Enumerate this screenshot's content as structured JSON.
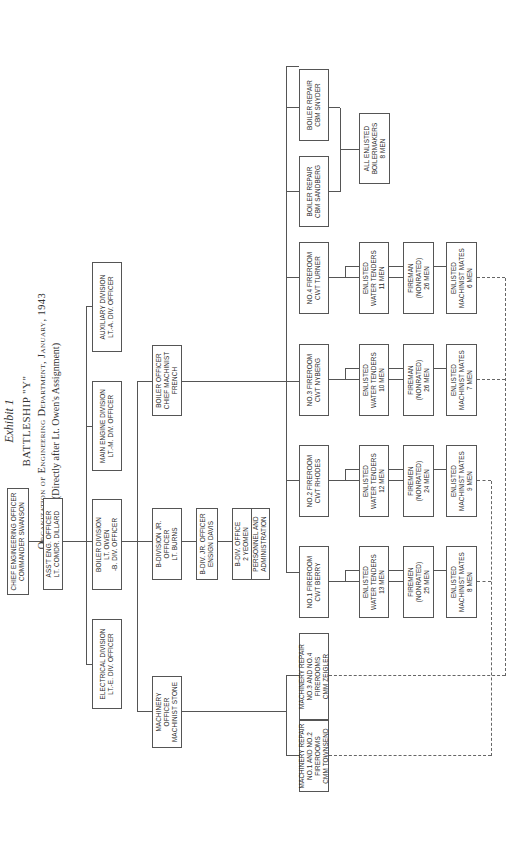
{
  "header": {
    "exhibit": "Exhibit 1",
    "ship": "BATTLESHIP \"Y\"",
    "subtitle": "Organization of Engineering Department, January, 1943",
    "note": "(Directly after Lt. Owen's Assignment)"
  },
  "chart": {
    "chief": [
      "CHIEF ENGINEERING OFFICER",
      "COMMANDER SWANSON"
    ],
    "asst": [
      "ASS'T ENG. OFFICER",
      "LT. COMDR. DILLARD"
    ],
    "divisions": [
      {
        "id": "electrical",
        "lines": [
          "ELECTRICAL DIVISION",
          "LT.-E. DIV. OFFICER"
        ]
      },
      {
        "id": "boiler",
        "lines": [
          "BOILER DIVISION",
          "LT. OWEN",
          "-B. DIV. OFFICER"
        ]
      },
      {
        "id": "main-engine",
        "lines": [
          "MAIN ENGINE DIVISION",
          "LT.-M. DIV. OFFICER"
        ]
      },
      {
        "id": "auxiliary",
        "lines": [
          "AUXILIARY DIVISION",
          "LT.-A. DIV. OFFICER"
        ]
      }
    ],
    "boiler_sub": {
      "machinery_officer": [
        "MACHINERY",
        "OFFICER",
        "MACHINIST STONE"
      ],
      "b_div_jr": [
        "B-DIVISION JR.",
        "OFFICER",
        "LT. BURNS"
      ],
      "boiler_officer": [
        "BOILER OFFICER",
        "CHIEF MACHINIST",
        "FRENCH"
      ],
      "ensign": [
        "B-DIV. JR. OFFICER",
        "ENSIGN DAVIS"
      ],
      "office_top": [
        "B-DIV. OFFICE",
        "2 YEOMEN"
      ],
      "office_bottom": [
        "PERSONNEL AND",
        "ADMINISTRATION"
      ]
    },
    "machinery_repair": [
      [
        "MACHINERY REPAIR",
        "NO.1 AND NO.2",
        "FIREROOMS",
        "CMM TOWNSEND"
      ],
      [
        "MACHINERY REPAIR",
        "NO.3 AND NO.4",
        "FIREROOMS",
        "CMM ZEIGLER"
      ]
    ],
    "firerooms": [
      {
        "head": [
          "NO.1 FIREROOM",
          "CWT BERRY"
        ],
        "water": [
          "ENLISTED",
          "WATER TENDERS",
          "13 MEN"
        ],
        "firemen": [
          "FIREMEN",
          "(NONRATED)",
          "25 MEN"
        ],
        "mates": [
          "ENLISTED",
          "MACHINIST MATES",
          "8 MEN"
        ]
      },
      {
        "head": [
          "NO.2 FIREROOM",
          "CWT RHODES"
        ],
        "water": [
          "ENLISTED",
          "WATER TENDERS",
          "12 MEN"
        ],
        "firemen": [
          "FIREMEN",
          "(NONRATED)",
          "24 MEN"
        ],
        "mates": [
          "ENLISTED",
          "MACHINIST MATES",
          "9 MEN"
        ]
      },
      {
        "head": [
          "NO.3 FIREROOM",
          "CWT NYBERG"
        ],
        "water": [
          "ENLISTED",
          "WATER TENDERS",
          "10 MEN"
        ],
        "firemen": [
          "FIREMAN",
          "(NONRATED)",
          "26 MEN"
        ],
        "mates": [
          "ENLISTED",
          "MACHINIST MATES",
          "7 MEN"
        ]
      },
      {
        "head": [
          "NO.4 FIREROOM",
          "CWT TURNER"
        ],
        "water": [
          "ENLISTED",
          "WATER TENDERS",
          "11 MEN"
        ],
        "firemen": [
          "FIREMAN",
          "(NONRATED)",
          "26 MEN"
        ],
        "mates": [
          "ENLISTED",
          "MACHINIST MATES",
          "6 MEN"
        ]
      }
    ],
    "boiler_repair": [
      [
        "BOILER REPAIR",
        "CBM SANDBERG"
      ],
      [
        "BOILER REPAIR",
        "CBM SNYDER"
      ]
    ],
    "boilermakers": [
      "ALL ENLISTED",
      "BOILERMAKERS",
      "8 MEN"
    ]
  }
}
